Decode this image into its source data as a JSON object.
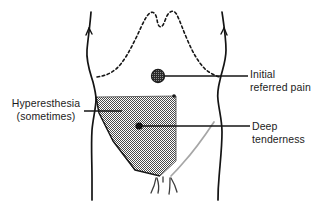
{
  "labels": {
    "hyperesthesia": {
      "line1": "Hyperesthesia",
      "line2": "(sometimes)"
    },
    "initial_referred_pain": {
      "line1": "Initial",
      "line2": "referred pain"
    },
    "deep_tenderness": {
      "line1": "Deep",
      "line2": "tenderness"
    }
  },
  "markers": {
    "initial_referred_pain_dot": "stippled-circle-marker",
    "deep_tenderness_dot": "solid-dot-marker",
    "hyperesthesia_region": "stippled-triangle-region"
  },
  "anatomy": {
    "torso_outline": "torso-outline",
    "costal_margin": "costal-margin-dashed",
    "inguinal_ligament": "inguinal-ligament-line",
    "pubic_marks": "pubic-hair-marks"
  },
  "colors": {
    "ink": "#141414",
    "text": "#1c1c1c",
    "stipple_dark": "#3a3a3a",
    "stipple_light": "#bdbdbd",
    "gray_line": "#a8a8a8",
    "background": "#ffffff"
  }
}
